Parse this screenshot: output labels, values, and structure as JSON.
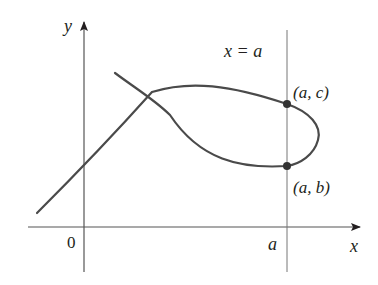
{
  "diagram": {
    "axes": {
      "x_label": "x",
      "y_label": "y",
      "origin_label": "0",
      "x_tick_label": "a"
    },
    "vertical_line_label": "x = a",
    "points": [
      {
        "label": "(a, c)"
      },
      {
        "label": "(a, b)"
      }
    ],
    "colors": {
      "curve": "#4a4a4a",
      "axes": "#555555",
      "text": "#231f20"
    }
  }
}
